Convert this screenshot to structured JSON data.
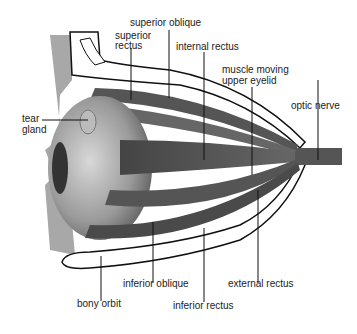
{
  "diagram": {
    "labels": {
      "superior_oblique": "superior oblique",
      "superior_rectus_1": "superior",
      "superior_rectus_2": "rectus",
      "internal_rectus": "internal rectus",
      "muscle_eyelid_1": "muscle moving",
      "muscle_eyelid_2": "upper eyelid",
      "optic_nerve": "optic nerve",
      "tear_gland_1": "tear",
      "tear_gland_2": "gland",
      "inferior_oblique": "inferior oblique",
      "external_rectus": "external rectus",
      "bony_orbit": "bony orbit",
      "inferior_rectus": "inferior rectus"
    }
  }
}
